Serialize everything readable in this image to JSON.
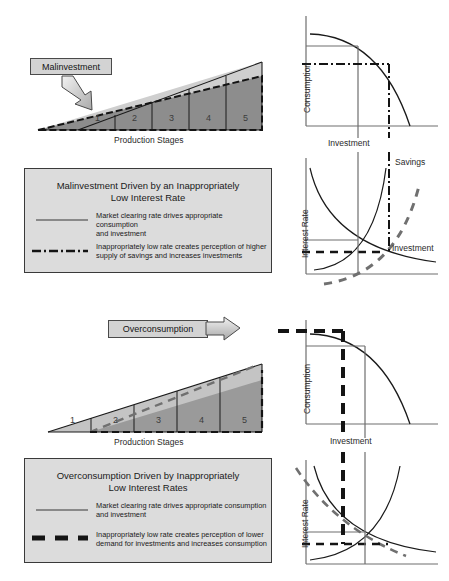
{
  "figure": {
    "type": "diagram"
  },
  "colors": {
    "ink": "#1a1a1a",
    "axis": "#6e6e6e",
    "triangle_light": "#c9c9c9",
    "triangle_dark": "#8a8a8a",
    "legend_bg": "#dcdcdc",
    "callout_bg": "#d3d3d3",
    "dashed_gray": "#707070",
    "heavy_dash": "#141414"
  },
  "panels": {
    "top": {
      "callout": {
        "label": "Malinvestment"
      },
      "triangle": {
        "axis_label": "Production Stages",
        "stages": [
          "1",
          "2",
          "3",
          "4",
          "5"
        ]
      },
      "ppf": {
        "ylabel": "Consumption",
        "xlabel": "Investment"
      },
      "loanable_funds": {
        "ylabel": "Interest Rate",
        "curve_savings": "Savings",
        "curve_investment": "Investment"
      },
      "legend": {
        "title_line1": "Malinvestment Driven by an Inappropriately",
        "title_line2": "Low Interest Rate",
        "entries": [
          {
            "style": "solid",
            "line1": "Market clearing rate drives appropriate consumption",
            "line2": "and investment"
          },
          {
            "style": "dash-dot",
            "line1": "Inappropriately low rate creates perception of higher",
            "line2": "supply of savings and increases investments"
          }
        ]
      }
    },
    "bottom": {
      "callout": {
        "label": "Overconsumption"
      },
      "triangle": {
        "axis_label": "Production Stages",
        "stages": [
          "1",
          "2",
          "3",
          "4",
          "5"
        ]
      },
      "ppf": {
        "ylabel": "Consumption",
        "xlabel": "Investment"
      },
      "loanable_funds": {
        "ylabel": "Interest Rate"
      },
      "legend": {
        "title_line1": "Overconsumption Driven by Inappropriately",
        "title_line2": "Low Interest Rates",
        "entries": [
          {
            "style": "solid",
            "line1": "Market clearing rate drives appropriate consumption",
            "line2": "and investment"
          },
          {
            "style": "heavy-dash",
            "line1": "Inappropriately low rate creates perception of lower",
            "line2": "demand for investments and increases consumption"
          }
        ]
      }
    }
  }
}
